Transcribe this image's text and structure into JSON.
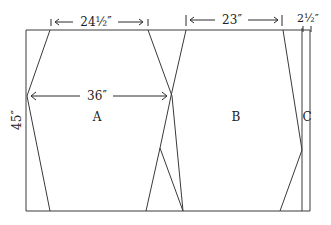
{
  "diagram": {
    "type": "cutting-layout",
    "dimensions": {
      "top_left_width": "24½″",
      "top_middle_width": "23″",
      "top_right_width": "2½″",
      "piece_a_width": "36″",
      "height": "45″"
    },
    "pieces": {
      "a": "A",
      "b": "B",
      "c": "C"
    },
    "colors": {
      "line": "#3a3a3a",
      "background": "#ffffff"
    }
  }
}
